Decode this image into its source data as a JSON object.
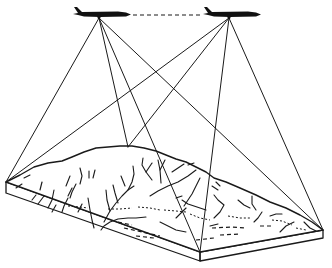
{
  "figure": {
    "colors": {
      "ink": "#1a1a1a",
      "background": "#ffffff"
    },
    "aircraft": [
      {
        "id": "aircraft-left",
        "exposure_station": [
          99,
          18
        ]
      },
      {
        "id": "aircraft-right",
        "exposure_station": [
          229,
          18
        ]
      }
    ],
    "flight_line": {
      "style": "dashed",
      "from": [
        132,
        15
      ],
      "to": [
        203,
        15
      ]
    },
    "terrain_block": {
      "corners": {
        "left": [
          6,
          182
        ],
        "front": [
          200,
          252
        ],
        "right": [
          323,
          230
        ],
        "ridge_top": [
          128,
          147
        ]
      }
    },
    "sight_lines_count": 8
  }
}
